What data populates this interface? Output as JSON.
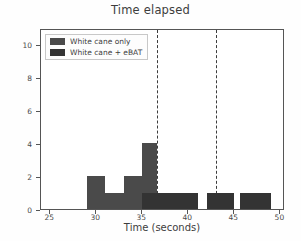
{
  "chart_data": {
    "type": "bar",
    "title": "Time elapsed",
    "xlabel": "Time (seconds)",
    "ylabel": "# Subjects",
    "xlim": [
      24,
      50.5
    ],
    "ylim": [
      0,
      11
    ],
    "xticks": [
      25,
      30,
      35,
      40,
      45,
      50
    ],
    "yticks": [
      0,
      2,
      4,
      6,
      8,
      10
    ],
    "grid": false,
    "legend_position": "upper-left",
    "legend": [
      "White cane only",
      "White cane + eBAT"
    ],
    "colors": {
      "series_0": "#4a4a4a",
      "series_1": "#333333",
      "reference_line": "#3c3c3c",
      "axis": "#555555"
    },
    "series": [
      {
        "name": "White cane only",
        "color": "#4a4a4a",
        "bins": [
          {
            "x0": 29.0,
            "x1": 31.0,
            "value": 2
          },
          {
            "x0": 31.0,
            "x1": 33.0,
            "value": 1
          },
          {
            "x0": 33.0,
            "x1": 35.0,
            "value": 2
          },
          {
            "x0": 35.0,
            "x1": 36.6,
            "value": 4
          }
        ]
      },
      {
        "name": "White cane + eBAT",
        "color": "#333333",
        "bins": [
          {
            "x0": 35.0,
            "x1": 36.6,
            "value": 1
          },
          {
            "x0": 36.6,
            "x1": 38.6,
            "value": 1
          },
          {
            "x0": 38.6,
            "x1": 41.0,
            "value": 1
          },
          {
            "x0": 42.0,
            "x1": 45.0,
            "value": 1
          },
          {
            "x0": 45.6,
            "x1": 49.0,
            "value": 1
          }
        ]
      }
    ],
    "reference_lines": [
      {
        "x": 36.6,
        "style": "dashed"
      },
      {
        "x": 43.0,
        "style": "dashed"
      }
    ]
  }
}
